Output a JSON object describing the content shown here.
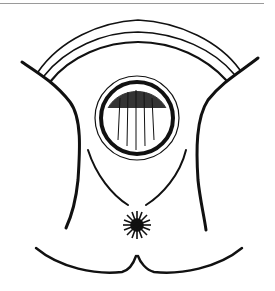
{
  "image": {
    "description": "Black-and-white line illustration (anatomical sketch) with concentric arcs on top, a dark circular shape in the center, and a radiating star-like mark near the bottom",
    "colors": {
      "ink": "#111111",
      "paper": "#ffffff",
      "border": "#9a9a9a"
    }
  }
}
